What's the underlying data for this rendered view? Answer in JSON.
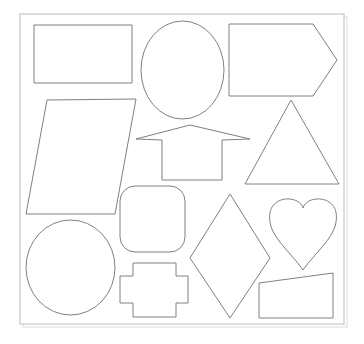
{
  "canvas": {
    "width": 364,
    "height": 344,
    "background_color": "#ffffff",
    "title": "Geometric shapes sheet"
  },
  "frame": {
    "name": "outer-frame",
    "x": 20,
    "y": 14,
    "width": 324,
    "height": 310,
    "stroke_color": "#d2d2d2",
    "fill_color": "#ffffff"
  },
  "style": {
    "shape_stroke_color": "#808080",
    "shape_fill_color": "#ffffff",
    "shape_stroke_width": 1
  },
  "shapes": [
    {
      "id": "rectangle",
      "label": "Rectangle",
      "type": "polygon",
      "points": "34,25 132,25 132,83 34,83"
    },
    {
      "id": "ellipse-top",
      "label": "Ellipse",
      "type": "ellipse",
      "cx": 182.5,
      "cy": 70,
      "rx": 41.5,
      "ry": 49
    },
    {
      "id": "pentagon-arrow-block",
      "label": "Pentagon",
      "type": "polygon",
      "points": "229,24 313,24 337,60 313,96 229,96"
    },
    {
      "id": "parallelogram",
      "label": "Parallelogram",
      "type": "polygon",
      "points": "47,100 136,99 115,214 26,214"
    },
    {
      "id": "arrow-up",
      "label": "Up arrow",
      "type": "polygon",
      "points": "190,125 250,139 222,140 222,180 162,180 162,140 136,139"
    },
    {
      "id": "triangle",
      "label": "Triangle",
      "type": "polygon",
      "points": "291,100 339,184 245,184"
    },
    {
      "id": "rounded-square",
      "label": "Rounded square",
      "type": "rounded-rect",
      "x": 120,
      "y": 186,
      "width": 65,
      "height": 66,
      "rx": 15
    },
    {
      "id": "diamond",
      "label": "Diamond",
      "type": "polygon",
      "points": "230,194 270,258 230,318 190,258"
    },
    {
      "id": "heart",
      "label": "Heart",
      "type": "path",
      "d": "M 303 270 C 292 254 272 238 270 222 C 267 204 280 198 290 199 C 298 200 302 204 303 208 C 304 204 308 200 316 199 C 326 198 339 204 336 222 C 334 238 314 254 303 270 Z"
    },
    {
      "id": "circle-ellipse",
      "label": "Circle",
      "type": "ellipse",
      "cx": 70.5,
      "cy": 267.5,
      "rx": 44.5,
      "ry": 47.5
    },
    {
      "id": "cross",
      "label": "Cross",
      "type": "polygon",
      "points": "133,263 176,263 176,276 188,276 188,303 176,303 176,317 133,317 133,303 120,303 120,276 133,276"
    },
    {
      "id": "quadrilateral",
      "label": "Quadrilateral",
      "type": "polygon",
      "points": "259,283 333,273 333,318 259,318"
    }
  ]
}
